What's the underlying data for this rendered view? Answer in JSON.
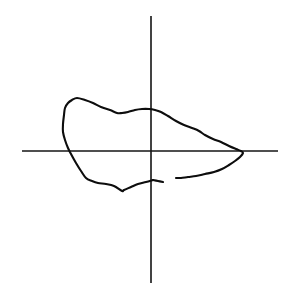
{
  "figure": {
    "title": "",
    "background_color": "#ffffff",
    "width": 294,
    "height": 298
  },
  "chart_data": {
    "type": "line",
    "title": "",
    "xlabel": "",
    "ylabel": "",
    "grid": false,
    "legend": null,
    "axes": {
      "origin_px": [
        151,
        151
      ],
      "x_axis": {
        "y_px": 151,
        "x_start_px": 22,
        "x_end_px": 278,
        "color": "#141414",
        "width_px": 1.6
      },
      "y_axis": {
        "x_px": 151,
        "y_start_px": 16,
        "y_end_px": 283,
        "color": "#141414",
        "width_px": 1.6
      },
      "xlim_px": [
        22,
        278
      ],
      "ylim_px": [
        16,
        283
      ]
    },
    "series": [
      {
        "name": "contour-outline",
        "closed": false,
        "color": "#0d0d0d",
        "width_px": 2.1,
        "points_px": [
          [
            153,
            180
          ],
          [
            146,
            182
          ],
          [
            138,
            184
          ],
          [
            131,
            187
          ],
          [
            124,
            190
          ],
          [
            122,
            191
          ],
          [
            114,
            186
          ],
          [
            106,
            184
          ],
          [
            98,
            183
          ],
          [
            92,
            181
          ],
          [
            86,
            178
          ],
          [
            81,
            171
          ],
          [
            76,
            163
          ],
          [
            71,
            154
          ],
          [
            68,
            148
          ],
          [
            65,
            140
          ],
          [
            63,
            132
          ],
          [
            63,
            124
          ],
          [
            64,
            115
          ],
          [
            65,
            108
          ],
          [
            68,
            103
          ],
          [
            72,
            100
          ],
          [
            77,
            98
          ],
          [
            85,
            100
          ],
          [
            93,
            103
          ],
          [
            101,
            107
          ],
          [
            110,
            110
          ],
          [
            117,
            113
          ],
          [
            122,
            113
          ],
          [
            128,
            112
          ],
          [
            135,
            110
          ],
          [
            142,
            109
          ],
          [
            149,
            109
          ],
          [
            155,
            110
          ],
          [
            161,
            112
          ],
          [
            168,
            116
          ],
          [
            176,
            121
          ],
          [
            184,
            125
          ],
          [
            192,
            128
          ],
          [
            199,
            131
          ],
          [
            205,
            135
          ],
          [
            213,
            139
          ],
          [
            221,
            142
          ],
          [
            229,
            146
          ],
          [
            236,
            149
          ],
          [
            241,
            151
          ],
          [
            243,
            153
          ],
          [
            240,
            157
          ],
          [
            235,
            161
          ],
          [
            229,
            165
          ],
          [
            222,
            169
          ],
          [
            214,
            172
          ],
          [
            205,
            174
          ],
          [
            196,
            176
          ],
          [
            188,
            177
          ],
          [
            181,
            178
          ],
          [
            176,
            178
          ]
        ]
      },
      {
        "name": "contour-tail-tick",
        "closed": false,
        "color": "#0d0d0d",
        "width_px": 2.1,
        "points_px": [
          [
            153,
            180
          ],
          [
            158,
            181
          ],
          [
            163,
            182
          ]
        ]
      }
    ],
    "annotations": [
      {
        "name": "gap",
        "description": "break in outline between lower-left terminus and lower-right terminus",
        "from_px": [
          163,
          182
        ],
        "to_px": [
          176,
          178
        ]
      }
    ]
  }
}
